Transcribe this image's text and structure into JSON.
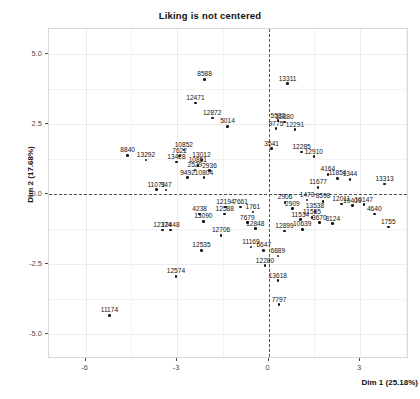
{
  "chart_data": {
    "type": "scatter",
    "title": "Liking is not centered",
    "xlabel": "Dim 1 (25.18%)",
    "ylabel": "Dim 2 (17.68%)",
    "xlim": [
      -7.2,
      4.6
    ],
    "ylim": [
      -5.9,
      5.9
    ],
    "xticks": [
      -6,
      -3,
      0,
      3
    ],
    "xticklabels": [
      "-6",
      "-3",
      "0",
      "3"
    ],
    "yticks": [
      -5.0,
      -2.5,
      0.0,
      2.5,
      5.0
    ],
    "yticklabels": [
      "-5.0",
      "-2.5",
      "0.0",
      "2.5",
      "5.0"
    ],
    "grid": true,
    "legend": false,
    "reference_lines": {
      "x": 0,
      "y": 0,
      "style": "dashed",
      "color": "#555555"
    },
    "point_color": "#141414",
    "points": [
      {
        "label": "8588",
        "x": -2.1,
        "y": 4.1
      },
      {
        "label": "13311",
        "x": 0.62,
        "y": 3.95
      },
      {
        "label": "12471",
        "x": -2.4,
        "y": 3.25
      },
      {
        "label": "12872",
        "x": -1.85,
        "y": 2.72
      },
      {
        "label": "5014",
        "x": -1.35,
        "y": 2.42
      },
      {
        "label": "5582",
        "x": 0.3,
        "y": 2.62
      },
      {
        "label": "12880",
        "x": 0.52,
        "y": 2.58
      },
      {
        "label": "9775",
        "x": 0.24,
        "y": 2.34
      },
      {
        "label": "12291",
        "x": 0.86,
        "y": 2.3
      },
      {
        "label": "8840",
        "x": -4.62,
        "y": 1.38
      },
      {
        "label": "13292",
        "x": -4.02,
        "y": 1.22
      },
      {
        "label": "3541",
        "x": 0.1,
        "y": 1.62
      },
      {
        "label": "12285",
        "x": 1.08,
        "y": 1.5
      },
      {
        "label": "12910",
        "x": 1.48,
        "y": 1.34
      },
      {
        "label": "10852",
        "x": -2.78,
        "y": 1.58
      },
      {
        "label": "7622",
        "x": -2.92,
        "y": 1.36
      },
      {
        "label": "13428",
        "x": -3.02,
        "y": 1.14
      },
      {
        "label": "13012",
        "x": -2.2,
        "y": 1.22
      },
      {
        "label": "10851",
        "x": -2.32,
        "y": 1.02
      },
      {
        "label": "2529",
        "x": -2.42,
        "y": 0.86
      },
      {
        "label": "2936",
        "x": -1.94,
        "y": 0.84
      },
      {
        "label": "9492",
        "x": -2.66,
        "y": 0.58
      },
      {
        "label": "10804",
        "x": -2.12,
        "y": 0.58
      },
      {
        "label": "4164",
        "x": 1.94,
        "y": 0.7
      },
      {
        "label": "11854",
        "x": 2.26,
        "y": 0.56
      },
      {
        "label": "1344",
        "x": 2.66,
        "y": 0.52
      },
      {
        "label": "13313",
        "x": 3.8,
        "y": 0.36
      },
      {
        "label": "11071",
        "x": -3.68,
        "y": 0.16
      },
      {
        "label": "947",
        "x": -3.36,
        "y": 0.14
      },
      {
        "label": "11677",
        "x": 1.62,
        "y": 0.24
      },
      {
        "label": "12011",
        "x": 2.38,
        "y": -0.36
      },
      {
        "label": "10409",
        "x": 2.74,
        "y": -0.42
      },
      {
        "label": "10147",
        "x": 3.12,
        "y": -0.38
      },
      {
        "label": "4640",
        "x": 3.46,
        "y": -0.72
      },
      {
        "label": "1755",
        "x": 3.92,
        "y": -1.18
      },
      {
        "label": "2909",
        "x": 0.78,
        "y": -0.52
      },
      {
        "label": "2906",
        "x": 0.54,
        "y": -0.3
      },
      {
        "label": "1473",
        "x": 1.26,
        "y": -0.22
      },
      {
        "label": "8598",
        "x": 1.78,
        "y": -0.26
      },
      {
        "label": "13538",
        "x": 1.52,
        "y": -0.62
      },
      {
        "label": "11534",
        "x": 1.04,
        "y": -0.92
      },
      {
        "label": "11535",
        "x": 1.42,
        "y": -0.84
      },
      {
        "label": "3670",
        "x": 1.66,
        "y": -1.02
      },
      {
        "label": "8124",
        "x": 2.1,
        "y": -1.06
      },
      {
        "label": "10639",
        "x": 1.1,
        "y": -1.26
      },
      {
        "label": "12899",
        "x": 0.52,
        "y": -1.32
      },
      {
        "label": "12194",
        "x": -1.42,
        "y": -0.46
      },
      {
        "label": "7661",
        "x": -0.92,
        "y": -0.46
      },
      {
        "label": "1761",
        "x": -0.52,
        "y": -0.64
      },
      {
        "label": "4238",
        "x": -2.26,
        "y": -0.72
      },
      {
        "label": "12588",
        "x": -1.44,
        "y": -0.72
      },
      {
        "label": "13090",
        "x": -2.14,
        "y": -0.98
      },
      {
        "label": "7679",
        "x": -0.7,
        "y": -1.02
      },
      {
        "label": "12848",
        "x": -0.44,
        "y": -1.24
      },
      {
        "label": "12374",
        "x": -3.48,
        "y": -1.28
      },
      {
        "label": "12448",
        "x": -3.22,
        "y": -1.28
      },
      {
        "label": "12706",
        "x": -1.56,
        "y": -1.48
      },
      {
        "label": "11169",
        "x": -0.58,
        "y": -1.9
      },
      {
        "label": "12535",
        "x": -2.2,
        "y": -2.02
      },
      {
        "label": "6647",
        "x": -0.16,
        "y": -2.02
      },
      {
        "label": "6889",
        "x": 0.3,
        "y": -2.22
      },
      {
        "label": "12280",
        "x": -0.12,
        "y": -2.56
      },
      {
        "label": "12574",
        "x": -3.04,
        "y": -2.94
      },
      {
        "label": "13618",
        "x": 0.3,
        "y": -3.1
      },
      {
        "label": "7797",
        "x": 0.34,
        "y": -3.96
      },
      {
        "label": "11174",
        "x": -5.22,
        "y": -4.34
      }
    ]
  }
}
